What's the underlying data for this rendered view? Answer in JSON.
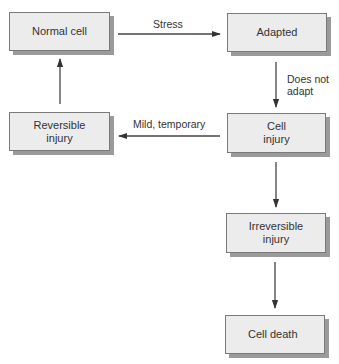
{
  "diagram": {
    "colors": {
      "box_fill": "#ececec",
      "box_border": "#7a7a7a",
      "box_shadow": "#9a9a9a",
      "arrow": "#333333",
      "text": "#333333"
    },
    "nodes": [
      {
        "id": "normal_cell",
        "label": "Normal cell"
      },
      {
        "id": "adapted",
        "label": "Adapted"
      },
      {
        "id": "cell_injury",
        "label": "Cell\ninjury"
      },
      {
        "id": "reversible_injury",
        "label": "Reversible\ninjury"
      },
      {
        "id": "irreversible_injury",
        "label": "Irreversible\ninjury"
      },
      {
        "id": "cell_death",
        "label": "Cell death"
      }
    ],
    "edges": [
      {
        "from": "normal_cell",
        "to": "adapted",
        "label": "Stress"
      },
      {
        "from": "adapted",
        "to": "cell_injury",
        "label": "Does not\nadapt"
      },
      {
        "from": "cell_injury",
        "to": "reversible_injury",
        "label": "Mild, temporary"
      },
      {
        "from": "reversible_injury",
        "to": "normal_cell",
        "label": ""
      },
      {
        "from": "cell_injury",
        "to": "irreversible_injury",
        "label": ""
      },
      {
        "from": "irreversible_injury",
        "to": "cell_death",
        "label": ""
      }
    ]
  }
}
